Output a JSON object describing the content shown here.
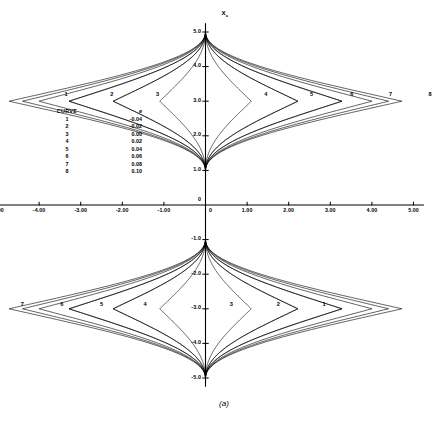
{
  "figure": {
    "caption": "(a)",
    "axis_label_x_top": "X",
    "axis_label_x_sub": "c"
  },
  "legend": {
    "header_curve": "CURVE",
    "header_symbol": "e",
    "rows": [
      {
        "curve": "1",
        "value": "-0.04"
      },
      {
        "curve": "2",
        "value": "-0.02"
      },
      {
        "curve": "3",
        "value": "0.00"
      },
      {
        "curve": "4",
        "value": "0.02"
      },
      {
        "curve": "5",
        "value": "0.04"
      },
      {
        "curve": "6",
        "value": "0.06"
      },
      {
        "curve": "7",
        "value": "0.08"
      },
      {
        "curve": "8",
        "value": "0.10"
      }
    ]
  },
  "axes": {
    "x_ticks": [
      "-5.00",
      "-4.00",
      "-3.00",
      "-2.00",
      "-1.00",
      "0",
      "1.00",
      "2.00",
      "3.00",
      "4.00",
      "5.00"
    ],
    "y_ticks_upper": [
      "5.0",
      "4.0",
      "3.0",
      "2.0",
      "1.0"
    ],
    "y_origin": "0",
    "y_ticks_lower": [
      "-1.0",
      "-2.0",
      "-3.0",
      "-4.0",
      "-5.0"
    ]
  },
  "curve_labels_upper": [
    "1",
    "2",
    "3",
    "4",
    "5",
    "6",
    "7",
    "8"
  ],
  "curve_labels_lower": [
    "8",
    "7",
    "6",
    "5",
    "4",
    "3",
    "2",
    "1"
  ],
  "chart_data": {
    "type": "line",
    "title": "",
    "xlabel": "",
    "ylabel": "X_c",
    "xlim": [
      -5.0,
      5.0
    ],
    "ylim": [
      -5.0,
      5.0
    ],
    "grid": false,
    "legend_position": "inset-left",
    "x_tick_values": [
      -5,
      -4,
      -3,
      -2,
      -1,
      0,
      1,
      2,
      3,
      4,
      5
    ],
    "y_tick_values": [
      -5,
      -4,
      -3,
      -2,
      -1,
      0,
      1,
      2,
      3,
      4,
      5
    ],
    "series": [
      {
        "name": "1",
        "param": -0.04,
        "half_width": 4.4,
        "label_upper_x": -3.35,
        "label_lower_x": 2.85
      },
      {
        "name": "2",
        "param": -0.02,
        "half_width": 3.28,
        "label_upper_x": -2.25,
        "label_lower_x": 1.75
      },
      {
        "name": "3",
        "param": 0.0,
        "half_width": 2.22,
        "label_upper_x": -1.15,
        "label_lower_x": 0.62
      },
      {
        "name": "4",
        "param": 0.02,
        "half_width": 1.1,
        "label_upper_x": 1.45,
        "label_lower_x": -1.45
      },
      {
        "name": "5",
        "param": 0.04,
        "half_width": 2.22,
        "label_upper_x": 2.55,
        "label_lower_x": -2.5
      },
      {
        "name": "6",
        "param": 0.06,
        "half_width": 3.28,
        "label_upper_x": 3.52,
        "label_lower_x": -3.45
      },
      {
        "name": "7",
        "param": 0.08,
        "half_width": 4.0,
        "label_upper_x": 4.45,
        "label_lower_x": -4.4
      },
      {
        "name": "8",
        "param": 0.1,
        "half_width": 4.72,
        "label_upper_x": 5.4,
        "label_lower_x": -5.35
      }
    ],
    "lobe_center_upper_y": 3.0,
    "lobe_center_lower_y": -3.0,
    "lobe_top_y": 5.0,
    "lobe_bottom_y": 1.0
  }
}
